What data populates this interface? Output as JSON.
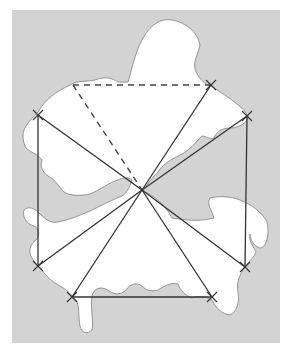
{
  "diagram": {
    "background": {
      "x": 12,
      "y": 10,
      "width": 268,
      "height": 333,
      "color": "#d3d3d3"
    },
    "island": {
      "fill": "#ffffff",
      "stroke": "#808080",
      "path": "M 38 112 C 45 100 55 92 70 85 C 78 80 86 82 95 80 C 105 76 112 78 118 82 L 128 82 C 132 70 134 55 142 40 C 150 25 160 18 172 20 C 185 22 198 32 200 45 C 198 55 192 62 196 72 C 200 80 205 84 211 86 C 220 92 230 98 237 104 C 242 108 246 112 248 116 C 248 122 240 128 230 128 C 222 128 216 132 214 138 C 210 140 206 136 202 136 C 196 142 190 150 180 155 C 170 160 162 165 158 172 C 150 180 146 186 143 191 C 155 196 165 205 172 218 C 185 220 198 222 214 218 C 212 210 206 204 210 198 C 218 196 230 196 240 200 C 252 205 262 212 267 222 C 270 235 266 248 260 248 C 254 246 250 240 250 234 C 248 240 254 248 256 252 C 254 258 248 262 245 267 C 240 274 236 282 238 292 C 240 304 236 312 230 315 C 222 314 216 308 212 300 C 206 296 198 296 192 298 C 186 296 180 290 178 284 C 172 282 164 286 158 290 C 150 292 146 290 142 286 C 136 282 130 284 126 290 C 120 296 112 294 108 290 C 100 286 94 288 92 296 C 90 308 94 322 92 330 C 88 334 82 334 80 326 C 78 316 80 306 76 300 C 72 296 68 290 60 286 C 52 282 46 276 42 270 C 38 266 34 262 32 258 C 28 252 30 244 36 240 C 40 236 40 228 34 226 C 26 224 22 216 24 210 C 28 206 34 208 38 212 C 44 218 50 224 58 222 C 68 220 78 216 88 212 C 100 206 112 200 122 196 C 128 192 130 186 132 180 C 128 176 122 178 118 180 C 110 182 100 190 90 194 C 80 196 70 196 64 192 C 58 186 56 180 48 176 C 42 172 40 166 42 160 C 38 154 30 152 26 148 C 22 140 22 132 26 126 C 30 120 34 116 38 112 Z"
    },
    "points": {
      "center": [
        142,
        190
      ],
      "top_left": [
        38,
        115
      ],
      "dash_start": [
        73,
        85
      ],
      "top_right": [
        211,
        85
      ],
      "right": [
        247,
        116
      ],
      "bottom_left": [
        38,
        266
      ],
      "bottom_1": [
        72,
        297
      ],
      "bottom_2": [
        212,
        297
      ],
      "bottom_right": [
        245,
        267
      ]
    },
    "line_color": "#333333",
    "dash_color": "#444444",
    "markers": [
      "top_left",
      "top_right",
      "right",
      "bottom_left",
      "bottom_1",
      "bottom_2",
      "bottom_right"
    ]
  }
}
